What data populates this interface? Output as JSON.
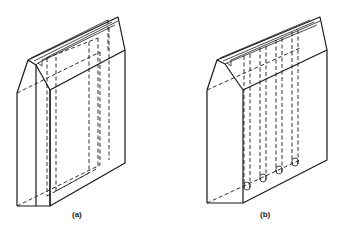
{
  "figure": {
    "panels": [
      {
        "id": "a",
        "label": "(a)",
        "hidden_features": "single large rectangular internal cavity/frame"
      },
      {
        "id": "b",
        "label": "(b)",
        "hidden_features": "four parallel vertical internal channels with rounded ends"
      }
    ]
  }
}
